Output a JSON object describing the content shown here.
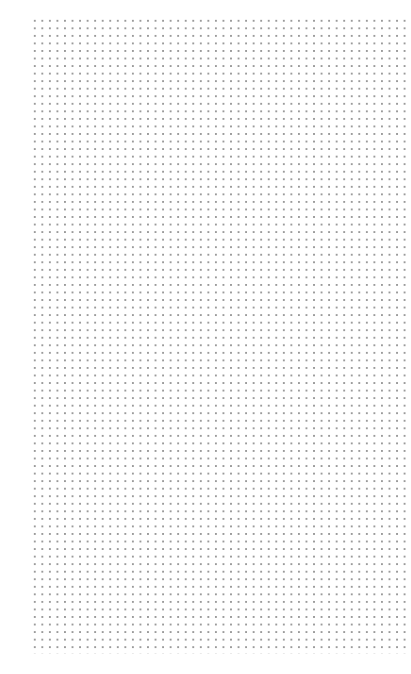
{
  "canvas": {
    "type": "dot-grid-paper",
    "background_color": "#ffffff",
    "dot_color": "#9a9a9a",
    "columns": 50,
    "rows": 85
  }
}
